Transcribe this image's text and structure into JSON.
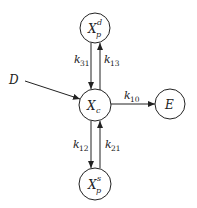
{
  "diagram": {
    "type": "compartment-model",
    "nodes": [
      {
        "id": "Xpd",
        "label": "X",
        "sup": "d",
        "sub": "p",
        "cx": 95,
        "cy": 28,
        "r": 15
      },
      {
        "id": "Xc",
        "label": "X",
        "sup": "",
        "sub": "c",
        "cx": 95,
        "cy": 105,
        "r": 16
      },
      {
        "id": "E",
        "label": "E",
        "sup": "",
        "sub": "",
        "cx": 170,
        "cy": 104,
        "r": 15
      },
      {
        "id": "Xps",
        "label": "X",
        "sup": "s",
        "sub": "p",
        "cx": 95,
        "cy": 184,
        "r": 16
      }
    ],
    "input": {
      "label": "D"
    },
    "edges": [
      {
        "from": "Xpd",
        "to": "Xc",
        "rate": "k",
        "rate_sub": "31"
      },
      {
        "from": "Xc",
        "to": "Xpd",
        "rate": "k",
        "rate_sub": "13"
      },
      {
        "from": "Xc",
        "to": "E",
        "rate": "k",
        "rate_sub": "10"
      },
      {
        "from": "Xc",
        "to": "Xps",
        "rate": "k",
        "rate_sub": "12"
      },
      {
        "from": "Xps",
        "to": "Xc",
        "rate": "k",
        "rate_sub": "21"
      },
      {
        "from": "D",
        "to": "Xc",
        "rate": "",
        "rate_sub": ""
      }
    ],
    "colors": {
      "stroke": "#222222",
      "background": "#ffffff"
    }
  }
}
